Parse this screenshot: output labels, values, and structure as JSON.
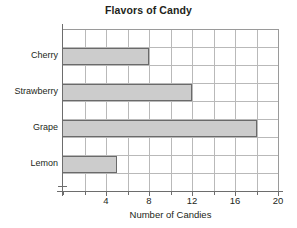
{
  "chart_data": {
    "type": "bar",
    "orientation": "horizontal",
    "title": "Flavors of Candy",
    "xlabel": "Number of Candies",
    "ylabel": "",
    "categories": [
      "Cherry",
      "Strawberry",
      "Grape",
      "Lemon"
    ],
    "values": [
      8,
      12,
      18,
      5
    ],
    "xlim": [
      0,
      20
    ],
    "xticks": [
      0,
      2,
      4,
      6,
      8,
      10,
      12,
      14,
      16,
      18,
      20
    ],
    "xtick_labels": [
      "",
      "",
      "4",
      "",
      "8",
      "",
      "12",
      "",
      "16",
      "",
      "20"
    ],
    "labeled_xticks": [
      4,
      8,
      12,
      16,
      20
    ],
    "grid": true,
    "grid_axis": "both",
    "legend": false,
    "bar_fill_color": "#cccccc",
    "bar_border_color": "#6a6a6a",
    "grid_color": "#b9b9b9",
    "axis_color": "#6d6d6d",
    "text_color": "#231f20",
    "background_color": "#ffffff",
    "series": [
      {
        "name": "Number of Candies",
        "points": [
          {
            "category": "Cherry",
            "value": 8
          },
          {
            "category": "Strawberry",
            "value": 12
          },
          {
            "category": "Grape",
            "value": 18
          },
          {
            "category": "Lemon",
            "value": 5
          }
        ]
      }
    ]
  }
}
